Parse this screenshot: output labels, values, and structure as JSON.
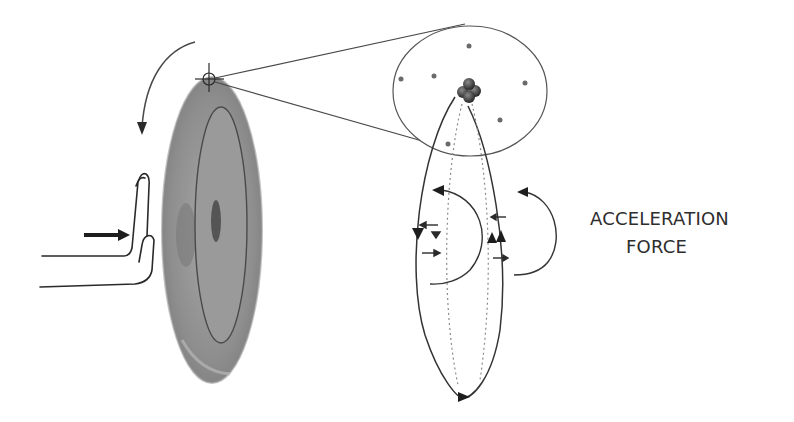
{
  "diagram": {
    "label": {
      "line1": "ACCELERATION",
      "line2": "FORCE"
    },
    "elements": {
      "hand": "hand pushing disc",
      "push_arrow": "arrow-right-icon",
      "rotation_arrow": "curved-arrow-down-icon",
      "disc": "rotating disc (gray)",
      "crosshair": "crosshair-icon marking point on disc rim",
      "magnified_circle": "magnified view of atom with nucleus and electrons",
      "orbit_ellipse": "elliptical path with direction arrows",
      "acceleration_arrows": "curved acceleration arrows"
    },
    "colors": {
      "disc_outer": "#8a8a8a",
      "disc_inner": "#a0a0a0",
      "line": "#3a3a3a",
      "text": "#2e2e2e"
    }
  }
}
